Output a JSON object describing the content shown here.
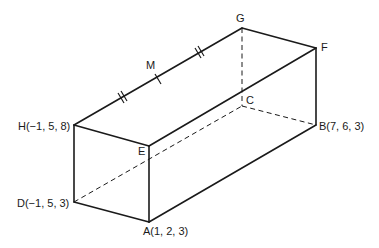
{
  "diagram": {
    "type": "rectangular prism (cuboid) in 3D coordinates",
    "colors": {
      "line": "#1a1a1a",
      "background": "#ffffff"
    },
    "vertices": {
      "A": {
        "label": "A(1, 2, 3)",
        "coords": [
          1,
          2,
          3
        ]
      },
      "B": {
        "label": "B(7, 6, 3)",
        "coords": [
          7,
          6,
          3
        ]
      },
      "C": {
        "label": "C"
      },
      "D": {
        "label": "D(−1, 5, 3)",
        "coords": [
          -1,
          5,
          3
        ]
      },
      "E": {
        "label": "E"
      },
      "F": {
        "label": "F"
      },
      "G": {
        "label": "G"
      },
      "H": {
        "label": "H(−1, 5, 8)",
        "coords": [
          -1,
          5,
          8
        ]
      },
      "M": {
        "label": "M",
        "note": "midpoint of HG"
      }
    },
    "solid_edges": [
      "HE",
      "HG",
      "GF",
      "EF",
      "HD",
      "EA",
      "DA",
      "AB",
      "FB"
    ],
    "hidden_edges": [
      "DC",
      "CB",
      "GC",
      "DB_diag"
    ],
    "marks": {
      "HM": "double tick",
      "MG": "double tick",
      "M": "single tick at midpoint"
    }
  }
}
